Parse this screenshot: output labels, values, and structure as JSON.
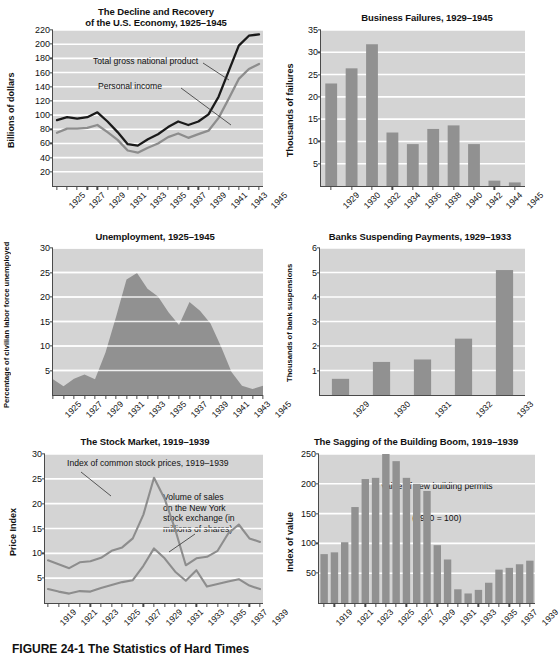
{
  "figure": {
    "caption_label": "FIGURE 24-1",
    "caption_title": "The Statistics of Hard Times"
  },
  "colors": {
    "plot_background": "#d4d4d4",
    "gridline": "#ffffff",
    "axis": "#4a4a4a",
    "bar_fill": "#919191",
    "area_fill": "#919191",
    "line_dark": "#1a1a1a",
    "line_gray": "#8d8d8d",
    "text": "#111111"
  },
  "charts": [
    {
      "id": "decline-and-recovery",
      "chart_data": {
        "type": "line",
        "title": "The Decline and Recovery\nof the U.S. Economy, 1925–1945",
        "title_line1": "The Decline and Recovery",
        "title_line2": "of the U.S. Economy, 1925–1945",
        "xlabel": "",
        "ylabel": "Billions of dollars",
        "ylim": [
          0,
          220
        ],
        "yticks": [
          20,
          40,
          60,
          80,
          100,
          120,
          140,
          160,
          180,
          200,
          220
        ],
        "x": [
          1925,
          1926,
          1927,
          1928,
          1929,
          1930,
          1931,
          1932,
          1933,
          1934,
          1935,
          1936,
          1937,
          1938,
          1939,
          1940,
          1941,
          1942,
          1943,
          1944,
          1945
        ],
        "xticks": [
          "1925",
          "1927",
          "1929",
          "1931",
          "1933",
          "1935",
          "1937",
          "1939",
          "1941",
          "1943",
          "1945"
        ],
        "grid": true,
        "legend_position": "inline-annotations",
        "annotations": [
          {
            "text": "Total gross national product",
            "series": "gnp"
          },
          {
            "text": "Personal income",
            "series": "personal_income"
          }
        ],
        "series": [
          {
            "name": "Total gross national product",
            "color": "#1a1a1a",
            "values": [
              93,
              97,
              95,
              97,
              104,
              91,
              76,
              59,
              57,
              66,
              73,
              83,
              91,
              86,
              91,
              101,
              126,
              162,
              198,
              212,
              214
            ]
          },
          {
            "name": "Personal income",
            "color": "#8d8d8d",
            "values": [
              75,
              81,
              81,
              82,
              86,
              76,
              65,
              50,
              47,
              54,
              60,
              69,
              74,
              68,
              73,
              78,
              96,
              123,
              151,
              165,
              172
            ]
          }
        ]
      }
    },
    {
      "id": "business-failures",
      "chart_data": {
        "type": "bar",
        "title": "Business Failures, 1929–1945",
        "xlabel": "",
        "ylabel": "Thousands of failures",
        "ylim": [
          0,
          35
        ],
        "yticks": [
          5,
          10,
          15,
          20,
          25,
          30,
          35
        ],
        "grid": true,
        "categories": [
          "1929",
          "1930",
          "1932",
          "1934",
          "1936",
          "1938",
          "1940",
          "1942",
          "1944",
          "1945"
        ],
        "values": [
          23.0,
          26.4,
          31.8,
          12.0,
          9.4,
          12.8,
          13.6,
          9.4,
          1.2,
          0.8
        ]
      }
    },
    {
      "id": "unemployment",
      "chart_data": {
        "type": "area",
        "title": "Unemployment, 1925–1945",
        "xlabel": "",
        "ylabel": "Percentage of civilian labor force unemployed",
        "ylim": [
          0,
          30
        ],
        "yticks": [
          5,
          10,
          15,
          20,
          25,
          30
        ],
        "grid": true,
        "x": [
          1925,
          1926,
          1927,
          1928,
          1929,
          1930,
          1931,
          1932,
          1933,
          1934,
          1935,
          1936,
          1937,
          1938,
          1939,
          1940,
          1941,
          1942,
          1943,
          1944,
          1945
        ],
        "xticks": [
          "1925",
          "1927",
          "1929",
          "1931",
          "1933",
          "1935",
          "1937",
          "1939",
          "1941",
          "1943",
          "1945"
        ],
        "values": [
          3.2,
          1.8,
          3.3,
          4.2,
          3.2,
          8.7,
          15.9,
          23.6,
          24.9,
          21.7,
          20.1,
          16.9,
          14.3,
          19.0,
          17.2,
          14.6,
          9.9,
          4.7,
          1.9,
          1.2,
          1.9
        ]
      }
    },
    {
      "id": "banks-suspending-payments",
      "chart_data": {
        "type": "bar",
        "title": "Banks Suspending Payments, 1929–1933",
        "xlabel": "",
        "ylabel": "Thousands of bank suspensions",
        "ylim": [
          0,
          6
        ],
        "yticks": [
          1,
          2,
          3,
          4,
          5,
          6
        ],
        "grid": true,
        "categories": [
          "1929",
          "1930",
          "1931",
          "1932",
          "1933"
        ],
        "values": [
          0.66,
          1.35,
          1.45,
          2.3,
          5.1
        ]
      }
    },
    {
      "id": "stock-market",
      "chart_data": {
        "type": "line",
        "title": "The Stock Market, 1919–1939",
        "xlabel": "",
        "ylabel": "Price Index",
        "ylim": [
          0,
          30
        ],
        "yticks": [
          5,
          10,
          15,
          20,
          25,
          30
        ],
        "grid": true,
        "x": [
          1919,
          1920,
          1921,
          1922,
          1923,
          1924,
          1925,
          1926,
          1927,
          1928,
          1929,
          1930,
          1931,
          1932,
          1933,
          1934,
          1935,
          1936,
          1937,
          1938,
          1939
        ],
        "xticks": [
          "1919",
          "1921",
          "1923",
          "1925",
          "1927",
          "1929",
          "1931",
          "1933",
          "1935",
          "1937",
          "1939"
        ],
        "annotations": [
          {
            "text": "Index of common stock prices, 1919–1939",
            "series": "stock_prices"
          },
          {
            "text": "Volume of sales\non the New York\nstock exchange (in\nmillions of shares)",
            "series": "volume_of_sales"
          }
        ],
        "series": [
          {
            "name": "Index of common stock prices, 1919–1939",
            "color": "#8d8d8d",
            "values": [
              8.6,
              7.8,
              7.0,
              8.2,
              8.4,
              9.1,
              10.5,
              11.2,
              13.0,
              17.8,
              25.2,
              21.0,
              14.8,
              7.6,
              9.0,
              9.3,
              10.5,
              14.0,
              15.8,
              13.0,
              12.3
            ]
          },
          {
            "name": "Volume of sales on the New York stock exchange (in millions of shares)",
            "color": "#8d8d8d",
            "values": [
              2.8,
              2.3,
              1.9,
              2.4,
              2.3,
              3.0,
              3.6,
              4.2,
              4.6,
              7.5,
              11.0,
              9.0,
              6.3,
              4.5,
              6.6,
              3.3,
              3.8,
              4.3,
              4.8,
              3.5,
              2.8
            ]
          }
        ]
      }
    },
    {
      "id": "building-boom",
      "chart_data": {
        "type": "bar",
        "title": "The Sagging of the Building Boom, 1919–1939",
        "xlabel": "",
        "ylabel": "Index of value",
        "ylim": [
          0,
          250
        ],
        "yticks": [
          50,
          100,
          150,
          200,
          250
        ],
        "grid": true,
        "annotations": [
          {
            "text": "Value of new building permits\n(1930 = 100)"
          }
        ],
        "annotation_line1": "Value of new building permits",
        "annotation_line2": "(1930 = 100)",
        "categories": [
          "1919",
          "1920",
          "1921",
          "1922",
          "1923",
          "1924",
          "1925",
          "1926",
          "1927",
          "1928",
          "1929",
          "1930",
          "1931",
          "1932",
          "1933",
          "1934",
          "1935",
          "1936",
          "1937",
          "1938",
          "1939"
        ],
        "xticks": [
          "1919",
          "1921",
          "1923",
          "1925",
          "1927",
          "1929",
          "1931",
          "1933",
          "1935",
          "1937",
          "1939"
        ],
        "values": [
          82,
          85,
          102,
          161,
          208,
          210,
          250,
          238,
          210,
          200,
          188,
          97,
          73,
          23,
          16,
          22,
          34,
          56,
          59,
          65,
          71
        ]
      }
    }
  ]
}
